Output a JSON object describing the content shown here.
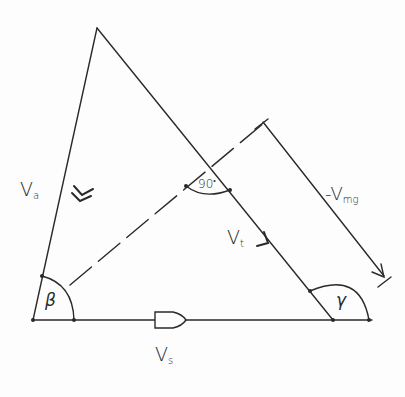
{
  "diagram": {
    "type": "velocity-vector-triangle",
    "labels": {
      "va": {
        "main": "V",
        "sub": "a"
      },
      "vt": {
        "main": "V",
        "sub": "t"
      },
      "vs": {
        "main": "V",
        "sub": "s"
      },
      "vmg": {
        "main": "-V",
        "sub": "mg"
      },
      "right_angle": "90",
      "right_angle_dot": "•",
      "beta": "β",
      "gamma": "γ"
    },
    "vertices": {
      "top": [
        97,
        28
      ],
      "bottom_left": [
        33,
        320
      ],
      "bottom_right": [
        333,
        320
      ]
    },
    "colors": {
      "line": "#2a2a2a",
      "background": "#fdfdfd"
    }
  }
}
